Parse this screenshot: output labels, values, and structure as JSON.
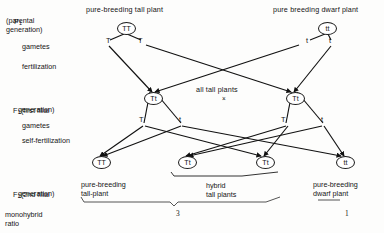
{
  "diagram": {
    "title_left": "pure-breeding tall plant",
    "title_right": "pure breeding dwarf plant",
    "middle_note": "all tall plants",
    "cross_symbol": "×",
    "stage_labels": {
      "p1_line1": "P",
      "p1_sub": "1",
      "p1_line2": "(parental",
      "p1_line3": "generation)",
      "gametes_1": "gametes",
      "fertilization": "fertilization",
      "f1_prefix": "F",
      "f1_sub": "1",
      "f1_text": "(first filial",
      "f1_text2": "generation)",
      "gametes_2": "gametes",
      "self_fertilization": "self-fertilization",
      "f2_prefix": "F",
      "f2_sub": "2",
      "f2_text": "(2nd filial",
      "f2_text2": "generation)",
      "monohybrid_line1": "monohybrid",
      "monohybrid_line2": "ratio"
    },
    "p1_genotypes": [
      {
        "label": "TT",
        "x": 117,
        "y": 22
      },
      {
        "label": "tt",
        "x": 318,
        "y": 22
      }
    ],
    "p1_gametes": [
      {
        "label": "T",
        "x": 106,
        "y": 41
      },
      {
        "label": "T",
        "x": 138,
        "y": 41
      },
      {
        "label": "t",
        "x": 296,
        "y": 41
      },
      {
        "label": "t",
        "x": 328,
        "y": 41
      }
    ],
    "f1_genotypes": [
      {
        "label": "Tt",
        "x": 146,
        "y": 92
      },
      {
        "label": "Tt",
        "x": 288,
        "y": 92
      }
    ],
    "f1_gametes": [
      {
        "label": "T",
        "x": 141,
        "y": 117
      },
      {
        "label": "t",
        "x": 178,
        "y": 117
      },
      {
        "label": "T",
        "x": 283,
        "y": 117
      },
      {
        "label": "t",
        "x": 320,
        "y": 117
      }
    ],
    "f2_genotypes": [
      {
        "label": "TT",
        "x": 92,
        "y": 156
      },
      {
        "label": "Tt",
        "x": 178,
        "y": 156
      },
      {
        "label": "Tt",
        "x": 256,
        "y": 156
      },
      {
        "label": "tt",
        "x": 336,
        "y": 156
      }
    ],
    "f2_captions": [
      {
        "line1": "pure-breeding",
        "line2": "tall-plant",
        "x": 81,
        "y": 180
      },
      {
        "line1": "hybrid",
        "line2": "tall plants",
        "x": 206,
        "y": 183
      },
      {
        "line1": "pure-breeding",
        "line2": "dwarf plant",
        "x": 315,
        "y": 180
      }
    ],
    "ratio_values": [
      {
        "value": "3",
        "x": 177,
        "y": 215
      },
      {
        "value": "1",
        "x": 345,
        "y": 215
      }
    ]
  }
}
